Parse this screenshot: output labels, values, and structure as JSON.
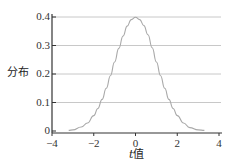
{
  "chart_data": {
    "type": "line",
    "title": "",
    "xlabel": "t值",
    "xlabel_italic_part": "t",
    "xlabel_rest": "值",
    "ylabel": "分布",
    "xlim": [
      -4,
      4
    ],
    "ylim": [
      0,
      0.4
    ],
    "xticks": [
      "-4",
      "-2",
      "0",
      "2",
      "4"
    ],
    "yticks": [
      "0",
      "0.1",
      "0.2",
      "0.3",
      "0.4"
    ],
    "grid": {
      "horizontal": true,
      "vertical": false
    },
    "legend": null,
    "series": [
      {
        "name": "t分布",
        "x": [
          -3.2,
          -3.0,
          -2.6,
          -2.3,
          -2.0,
          -1.8,
          -1.6,
          -1.4,
          -1.2,
          -1.0,
          -0.8,
          -0.6,
          -0.4,
          -0.2,
          0.0,
          0.2,
          0.4,
          0.6,
          0.8,
          1.0,
          1.2,
          1.4,
          1.6,
          1.8,
          2.0,
          2.3,
          2.6,
          3.0,
          3.3
        ],
        "values": [
          0.002,
          0.004,
          0.014,
          0.028,
          0.054,
          0.079,
          0.111,
          0.15,
          0.194,
          0.242,
          0.29,
          0.333,
          0.368,
          0.391,
          0.399,
          0.391,
          0.37,
          0.338,
          0.292,
          0.242,
          0.194,
          0.15,
          0.111,
          0.079,
          0.054,
          0.028,
          0.012,
          0.004,
          0.002
        ]
      }
    ]
  },
  "colors": {
    "curve": "#a9a9a9",
    "grid": "#c8c8c8",
    "axis": "#333333"
  }
}
